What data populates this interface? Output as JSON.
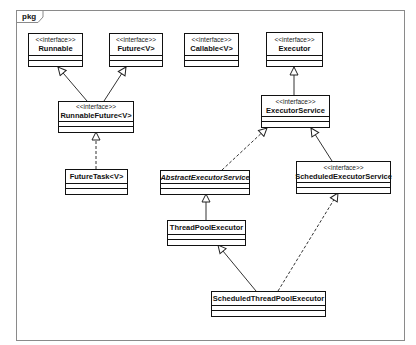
{
  "package": {
    "label": "pkg"
  },
  "classes": [
    {
      "id": "runnable",
      "stereotype": "<<interface>>",
      "name": "Runnable"
    },
    {
      "id": "future",
      "stereotype": "<<interface>>",
      "name": "Future<V>"
    },
    {
      "id": "callable",
      "stereotype": "<<interface>>",
      "name": "Callable<V>"
    },
    {
      "id": "executor",
      "stereotype": "<<interface>>",
      "name": "Executor"
    },
    {
      "id": "runnable_future",
      "stereotype": "<<interface>>",
      "name": "RunnableFuture<V>"
    },
    {
      "id": "executor_service",
      "stereotype": "<<interface>>",
      "name": "ExecutorService"
    },
    {
      "id": "future_task",
      "stereotype": "",
      "name": "FutureTask<V>"
    },
    {
      "id": "abstract_executor_service",
      "stereotype": "",
      "name": "AbstractExecutorService",
      "abstract": true
    },
    {
      "id": "scheduled_executor_service",
      "stereotype": "<<interface>>",
      "name": "ScheduledExecutorService"
    },
    {
      "id": "thread_pool_executor",
      "stereotype": "",
      "name": "ThreadPoolExecutor"
    },
    {
      "id": "scheduled_thread_pool_executor",
      "stereotype": "",
      "name": "ScheduledThreadPoolExecutor"
    }
  ],
  "relations": [
    {
      "from": "RunnableFuture<V>",
      "to": "Runnable",
      "type": "generalization"
    },
    {
      "from": "RunnableFuture<V>",
      "to": "Future<V>",
      "type": "generalization"
    },
    {
      "from": "FutureTask<V>",
      "to": "RunnableFuture<V>",
      "type": "realization"
    },
    {
      "from": "ExecutorService",
      "to": "Executor",
      "type": "generalization"
    },
    {
      "from": "AbstractExecutorService",
      "to": "ExecutorService",
      "type": "realization"
    },
    {
      "from": "ScheduledExecutorService",
      "to": "ExecutorService",
      "type": "generalization"
    },
    {
      "from": "ThreadPoolExecutor",
      "to": "AbstractExecutorService",
      "type": "generalization"
    },
    {
      "from": "ScheduledThreadPoolExecutor",
      "to": "ThreadPoolExecutor",
      "type": "generalization"
    },
    {
      "from": "ScheduledThreadPoolExecutor",
      "to": "ScheduledExecutorService",
      "type": "realization"
    }
  ]
}
